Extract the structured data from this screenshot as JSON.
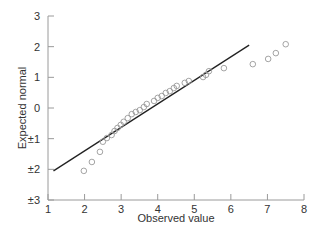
{
  "chart_data": {
    "type": "scatter",
    "title": "",
    "xlabel": "Observed value",
    "ylabel": "Expected normal",
    "xlim": [
      1,
      8
    ],
    "ylim": [
      -3,
      3
    ],
    "grid": false,
    "legend": null,
    "x_ticks": [
      1,
      2,
      3,
      4,
      5,
      6,
      7,
      8
    ],
    "x_tick_labels": [
      "1",
      "2",
      "3",
      "4",
      "5",
      "6",
      "7",
      "8"
    ],
    "y_ticks": [
      3,
      2,
      1,
      0,
      -1,
      -2,
      -3
    ],
    "y_tick_labels": [
      "3",
      "2",
      "1",
      "0",
      "±1",
      "±2",
      "±3"
    ],
    "reference_line": {
      "x": [
        1.15,
        6.5
      ],
      "y": [
        -2.05,
        2.05
      ]
    },
    "series": [
      {
        "name": "Observations",
        "marker": "open-circle",
        "points": [
          [
            1.98,
            -2.05
          ],
          [
            2.2,
            -1.76
          ],
          [
            2.42,
            -1.43
          ],
          [
            2.5,
            -1.1
          ],
          [
            2.61,
            -0.98
          ],
          [
            2.74,
            -0.88
          ],
          [
            2.82,
            -0.75
          ],
          [
            2.9,
            -0.65
          ],
          [
            2.99,
            -0.55
          ],
          [
            3.07,
            -0.45
          ],
          [
            3.18,
            -0.33
          ],
          [
            3.29,
            -0.2
          ],
          [
            3.4,
            -0.13
          ],
          [
            3.51,
            -0.07
          ],
          [
            3.62,
            0.03
          ],
          [
            3.7,
            0.13
          ],
          [
            3.9,
            0.23
          ],
          [
            4.0,
            0.33
          ],
          [
            4.11,
            0.39
          ],
          [
            4.22,
            0.49
          ],
          [
            4.33,
            0.55
          ],
          [
            4.44,
            0.65
          ],
          [
            4.52,
            0.72
          ],
          [
            4.74,
            0.82
          ],
          [
            4.85,
            0.88
          ],
          [
            5.24,
            1.01
          ],
          [
            5.32,
            1.08
          ],
          [
            5.4,
            1.2
          ],
          [
            5.81,
            1.3
          ],
          [
            6.6,
            1.43
          ],
          [
            7.02,
            1.6
          ],
          [
            7.23,
            1.79
          ],
          [
            7.5,
            2.08
          ]
        ]
      }
    ]
  },
  "colors": {
    "axis": "#9a9a9a",
    "points": "#9a9a9a",
    "fit_line": "#222222",
    "text": "#333333"
  }
}
